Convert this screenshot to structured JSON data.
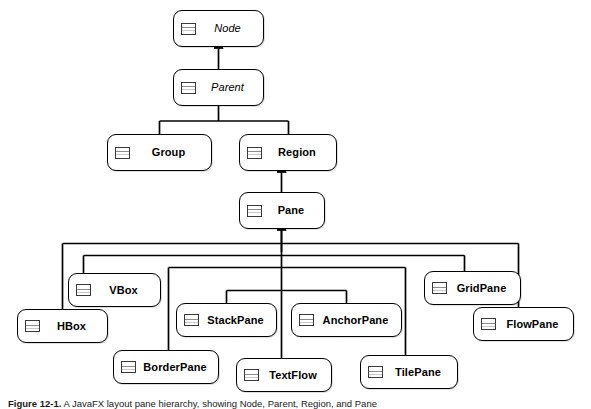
{
  "figure": {
    "caption_label": "Figure 12-1.",
    "caption_text": " A JavaFX layout pane hierarchy, showing Node, Parent, Region, and Pane",
    "icon_name": "uml-class-icon"
  },
  "diagram": {
    "type": "uml-class-hierarchy",
    "relationship": "generalization",
    "arrow_style": "filled-closed-triangle",
    "line_color": "#000000",
    "box_fill": "#ffffff",
    "box_border": "#000000",
    "nodes": [
      {
        "id": "node",
        "label": "Node",
        "kind": "abstract",
        "x": 173,
        "y": 10,
        "w": 91,
        "h": 37
      },
      {
        "id": "parent",
        "label": "Parent",
        "kind": "abstract",
        "x": 173,
        "y": 69,
        "w": 91,
        "h": 37
      },
      {
        "id": "group",
        "label": "Group",
        "kind": "concrete",
        "x": 107,
        "y": 134,
        "w": 105,
        "h": 37
      },
      {
        "id": "region",
        "label": "Region",
        "kind": "concrete",
        "x": 239,
        "y": 134,
        "w": 98,
        "h": 37
      },
      {
        "id": "pane",
        "label": "Pane",
        "kind": "concrete",
        "x": 239,
        "y": 192,
        "w": 86,
        "h": 37
      },
      {
        "id": "vbox",
        "label": "VBox",
        "kind": "concrete",
        "x": 68,
        "y": 273,
        "w": 93,
        "h": 34
      },
      {
        "id": "hbox",
        "label": "HBox",
        "kind": "concrete",
        "x": 17,
        "y": 309,
        "w": 91,
        "h": 34
      },
      {
        "id": "stackpane",
        "label": "StackPane",
        "kind": "concrete",
        "x": 176,
        "y": 303,
        "w": 101,
        "h": 34
      },
      {
        "id": "anchorpane",
        "label": "AnchorPane",
        "kind": "concrete",
        "x": 291,
        "y": 303,
        "w": 111,
        "h": 34
      },
      {
        "id": "borderpane",
        "label": "BorderPane",
        "kind": "concrete",
        "x": 113,
        "y": 350,
        "w": 106,
        "h": 34
      },
      {
        "id": "textflow",
        "label": "TextFlow",
        "kind": "concrete",
        "x": 236,
        "y": 358,
        "w": 96,
        "h": 34
      },
      {
        "id": "tilepane",
        "label": "TilePane",
        "kind": "concrete",
        "x": 360,
        "y": 355,
        "w": 98,
        "h": 34
      },
      {
        "id": "gridpane",
        "label": "GridPane",
        "kind": "concrete",
        "x": 424,
        "y": 271,
        "w": 97,
        "h": 34
      },
      {
        "id": "flowpane",
        "label": "FlowPane",
        "kind": "concrete",
        "x": 473,
        "y": 307,
        "w": 101,
        "h": 34
      }
    ],
    "edges": [
      {
        "from": "parent",
        "to": "node",
        "style": "straight"
      },
      {
        "from": "group",
        "to": "parent",
        "style": "elbow"
      },
      {
        "from": "region",
        "to": "parent",
        "style": "elbow"
      },
      {
        "from": "pane",
        "to": "region",
        "style": "straight"
      },
      {
        "from": "vbox",
        "to": "pane",
        "style": "bus"
      },
      {
        "from": "hbox",
        "to": "pane",
        "style": "bus"
      },
      {
        "from": "stackpane",
        "to": "pane",
        "style": "bus"
      },
      {
        "from": "anchorpane",
        "to": "pane",
        "style": "bus"
      },
      {
        "from": "borderpane",
        "to": "pane",
        "style": "bus"
      },
      {
        "from": "textflow",
        "to": "pane",
        "style": "bus"
      },
      {
        "from": "tilepane",
        "to": "pane",
        "style": "bus"
      },
      {
        "from": "gridpane",
        "to": "pane",
        "style": "bus"
      },
      {
        "from": "flowpane",
        "to": "pane",
        "style": "bus"
      }
    ]
  }
}
